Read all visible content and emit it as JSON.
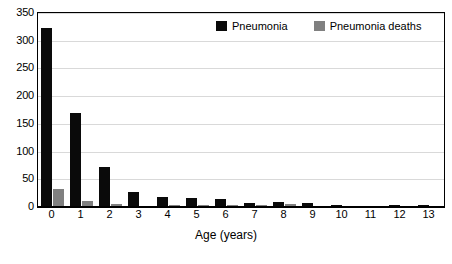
{
  "chart_data": {
    "type": "bar",
    "title": "",
    "subtitle": "",
    "xlabel": "Age (years)",
    "ylabel": "",
    "categories": [
      "0",
      "1",
      "2",
      "3",
      "4",
      "5",
      "6",
      "7",
      "8",
      "9",
      "10",
      "11",
      "12",
      "13"
    ],
    "series": [
      {
        "name": "Pneumonia",
        "color": "#0a0a0a",
        "values": [
          323,
          170,
          72,
          27,
          18,
          16,
          14,
          8,
          9,
          7,
          4,
          0,
          4,
          4
        ]
      },
      {
        "name": "Pneumonia deaths",
        "color": "#808080",
        "values": [
          32,
          11,
          5,
          1,
          3,
          3,
          3,
          3,
          5,
          0,
          0,
          0,
          0,
          0
        ]
      }
    ],
    "ylim": [
      0,
      350
    ],
    "yticks": [
      0,
      50,
      100,
      150,
      200,
      250,
      300,
      350
    ],
    "ytick_labels": [
      "0",
      "50",
      "100",
      "150",
      "200",
      "250",
      "300",
      "350"
    ],
    "grid": true,
    "grid_axis": "y",
    "legend_position": "top-inside",
    "legend": [
      "Pneumonia",
      "Pneumonia deaths"
    ],
    "annotations": []
  },
  "colors": {
    "primary_series": "#0a0a0a",
    "secondary_series": "#808080",
    "gridline": "#d9d9d9",
    "axis": "#000000",
    "background": "#ffffff"
  }
}
